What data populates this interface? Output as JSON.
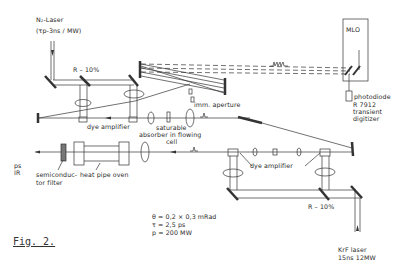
{
  "figure": {
    "caption": "Fig. 2.",
    "labels": {
      "n2_laser": "N₂-Laser",
      "n2_laser_params": "(τp-3ns / MW)",
      "r10_top": "R – 10%",
      "dye_amplifier_top": "dye amplifier",
      "saturable_absorber_1": "saturable",
      "saturable_absorber_2": "absorber in flowing",
      "saturable_absorber_3": "cell",
      "imm_aperture": "imm. aperture",
      "mlo": "MLO",
      "photodiode": "photodiode",
      "digitizer_1": "R 7912",
      "digitizer_2": "transient",
      "digitizer_3": "digitizer",
      "ps_ir_1": "ps",
      "ps_ir_2": "IR",
      "semiconductor_filter_1": "semiconduc-",
      "semiconductor_filter_2": "tor filter",
      "heat_pipe_oven": "heat pipe oven",
      "dye_amplifier_bottom": "dye amplifier",
      "r10_bottom": "R – 10%",
      "krf_laser_1": "KrF laser",
      "krf_laser_2": "15ns  12MW",
      "param_theta": "θ = 0,2 × 0,3 mRad",
      "param_tau": "τ = 2,5 ps",
      "param_p": "p = 200 MW"
    }
  }
}
